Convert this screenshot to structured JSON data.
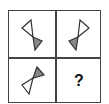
{
  "puzzle": {
    "cells": [
      {
        "icon": "bowtie-icon",
        "open_triangle": "top-left",
        "filled_triangle": "bottom-right"
      },
      {
        "icon": "bowtie-icon",
        "open_triangle": "top-right",
        "filled_triangle": "bottom-left"
      },
      {
        "icon": "bowtie-icon",
        "open_triangle": "bottom-left",
        "filled_triangle": "top-right"
      },
      {
        "icon": "question-mark",
        "label": "?"
      }
    ],
    "colors": {
      "stroke": "#333333",
      "fill": "#888888",
      "grid": "#444444"
    }
  }
}
